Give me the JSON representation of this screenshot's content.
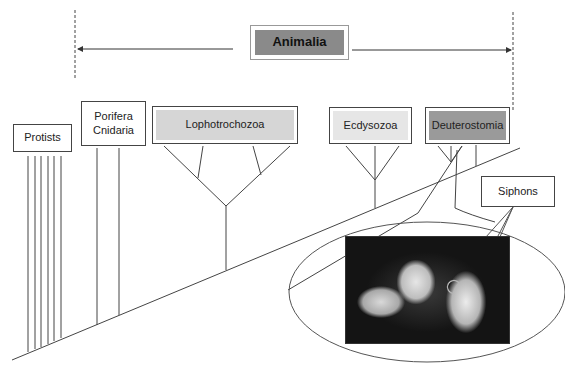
{
  "diagram": {
    "title": "Animalia",
    "colors": {
      "animalia_fill": "#8a8a8a",
      "lophotrochozoa_fill": "#d6d6d6",
      "ecdysozoa_fill": "#e6e6e6",
      "deuterostomia_fill": "#9a9a9a",
      "line": "#444444"
    },
    "groups": [
      {
        "label": "Protists"
      },
      {
        "label": "Porifera\nCnidaria"
      },
      {
        "label": "Lophotrochozoa"
      },
      {
        "label": "Ecdysozoa"
      },
      {
        "label": "Deuterostomia"
      }
    ],
    "callout": {
      "label": "Siphons"
    },
    "photo": {
      "description": "sea squirt (tunicate) photograph"
    }
  }
}
